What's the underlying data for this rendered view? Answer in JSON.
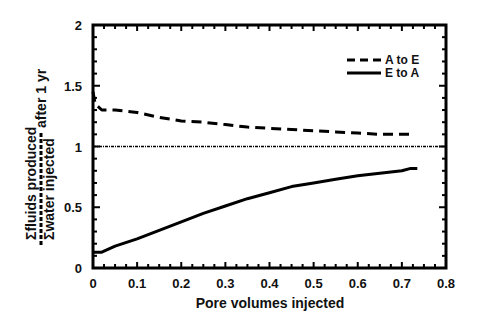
{
  "chart_data": {
    "type": "line",
    "title": "",
    "xlabel": "Pore volumes injected",
    "ylabel_numerator": "Σfluids produced",
    "ylabel_denominator": "Σwater injected",
    "ylabel_suffix": "after 1 yr",
    "xlim": [
      0,
      0.8
    ],
    "ylim": [
      0,
      2
    ],
    "xticks": [
      "0",
      "0.1",
      "0.2",
      "0.3",
      "0.4",
      "0.5",
      "0.6",
      "0.7",
      "0.8"
    ],
    "yticks": [
      "0",
      "0.5",
      "1",
      "1.5",
      "2"
    ],
    "grid": false,
    "legend_position": "upper right",
    "reference_line": {
      "y": 1,
      "style": "dotted"
    },
    "series": [
      {
        "name": "A to E",
        "style": "dashed",
        "x": [
          0,
          0.005,
          0.02,
          0.05,
          0.1,
          0.15,
          0.2,
          0.25,
          0.3,
          0.35,
          0.4,
          0.45,
          0.5,
          0.55,
          0.6,
          0.65,
          0.7,
          0.72
        ],
        "y": [
          1.45,
          1.35,
          1.3,
          1.3,
          1.28,
          1.24,
          1.21,
          1.2,
          1.18,
          1.16,
          1.15,
          1.14,
          1.13,
          1.12,
          1.11,
          1.1,
          1.1,
          1.1
        ]
      },
      {
        "name": "E to A",
        "style": "solid",
        "x": [
          0,
          0.02,
          0.05,
          0.1,
          0.15,
          0.2,
          0.25,
          0.3,
          0.35,
          0.4,
          0.45,
          0.5,
          0.55,
          0.6,
          0.65,
          0.7,
          0.72,
          0.735
        ],
        "y": [
          0.13,
          0.13,
          0.18,
          0.24,
          0.31,
          0.38,
          0.45,
          0.51,
          0.57,
          0.62,
          0.67,
          0.7,
          0.73,
          0.76,
          0.78,
          0.8,
          0.82,
          0.82
        ]
      }
    ]
  }
}
